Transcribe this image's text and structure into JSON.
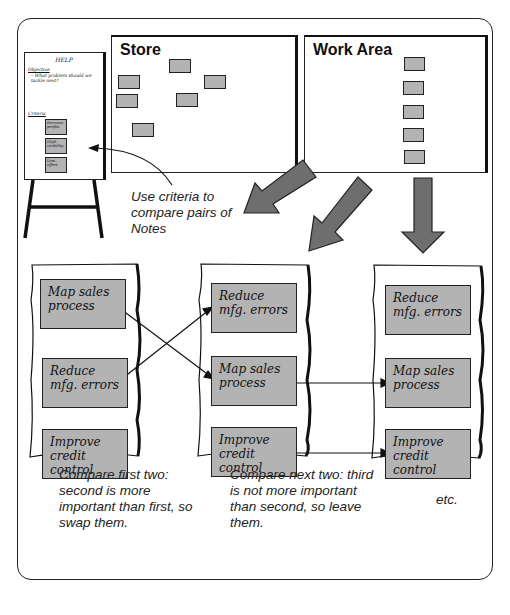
{
  "help_chart": {
    "title": "HELP",
    "objective_label": "Objective",
    "objective_text": "– What problem should we tackle next?",
    "criteria_label": "Criteria",
    "criteria": [
      "Increase profits",
      "High visibility",
      "Low effort"
    ]
  },
  "store": {
    "title": "Store"
  },
  "work_area": {
    "title": "Work Area"
  },
  "instruction": "Use criteria to compare pairs of Notes",
  "columns": [
    {
      "notes": [
        "Map sales process",
        "Reduce mfg. errors",
        "Improve credit control"
      ]
    },
    {
      "notes": [
        "Reduce mfg. errors",
        "Map sales process",
        "Improve credit control"
      ]
    },
    {
      "notes": [
        "Reduce mfg. errors",
        "Map sales process",
        "Improve credit control"
      ]
    }
  ],
  "captions": [
    "Compare first two: second is more important than first, so swap them.",
    "Compare next two: third is not more important than second, so leave them.",
    "etc."
  ],
  "colors": {
    "note_fill": "#b3b3b3",
    "arrow_fill": "#6e6e6e",
    "stroke": "#222222"
  }
}
